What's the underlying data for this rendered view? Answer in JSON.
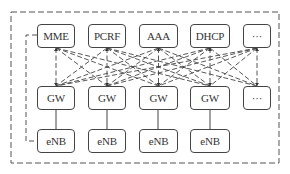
{
  "diagram": {
    "type": "network-architecture",
    "core_row": [
      {
        "id": "mme",
        "label": "MME",
        "x": 37,
        "y": 24,
        "w": 38,
        "h": 24
      },
      {
        "id": "pcrf",
        "label": "PCRF",
        "x": 88,
        "y": 24,
        "w": 38,
        "h": 24
      },
      {
        "id": "aaa",
        "label": "AAA",
        "x": 139,
        "y": 24,
        "w": 39,
        "h": 24
      },
      {
        "id": "dhcp",
        "label": "DHCP",
        "x": 190,
        "y": 24,
        "w": 40,
        "h": 24
      },
      {
        "id": "core-more",
        "label": "···",
        "x": 243,
        "y": 24,
        "w": 28,
        "h": 24
      }
    ],
    "gw_row": [
      {
        "id": "gw1",
        "label": "GW",
        "x": 37,
        "y": 86,
        "w": 38,
        "h": 24
      },
      {
        "id": "gw2",
        "label": "GW",
        "x": 88,
        "y": 86,
        "w": 38,
        "h": 24
      },
      {
        "id": "gw3",
        "label": "GW",
        "x": 139,
        "y": 86,
        "w": 39,
        "h": 24
      },
      {
        "id": "gw4",
        "label": "GW",
        "x": 190,
        "y": 86,
        "w": 40,
        "h": 24
      },
      {
        "id": "gw-more",
        "label": "···",
        "x": 243,
        "y": 86,
        "w": 28,
        "h": 24
      }
    ],
    "enb_row": [
      {
        "id": "enb1",
        "label": "eNB",
        "x": 37,
        "y": 129,
        "w": 38,
        "h": 24
      },
      {
        "id": "enb2",
        "label": "eNB",
        "x": 88,
        "y": 129,
        "w": 38,
        "h": 24
      },
      {
        "id": "enb3",
        "label": "eNB",
        "x": 139,
        "y": 129,
        "w": 39,
        "h": 24
      },
      {
        "id": "enb4",
        "label": "eNB",
        "x": 190,
        "y": 129,
        "w": 40,
        "h": 24
      }
    ],
    "colors": {
      "stroke": "#444444",
      "text": "#333333",
      "background": "#ffffff"
    },
    "edges": {
      "solid": "GW to eNB (vertical)",
      "dashed_mesh": "every core node to every GW",
      "dashed_side": "MME to eNB along left side",
      "outer_boundary": "dashed rectangle"
    }
  }
}
